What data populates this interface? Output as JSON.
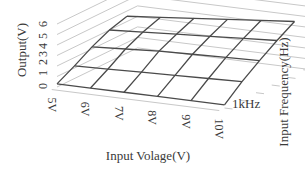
{
  "chart_data": {
    "type": "surface3d",
    "title": "",
    "xlabel": "Input Volage(V)",
    "ylabel": "Input Frequency(Hz)",
    "zlabel": "Output(V)",
    "x_ticks": [
      "5V",
      "6V",
      "7V",
      "8V",
      "9V",
      "10V"
    ],
    "y_ticks": [
      "1kHz"
    ],
    "z_ticks": [
      "0",
      "1",
      "2",
      "3",
      "4",
      "5",
      "6"
    ],
    "zlim": [
      0,
      6
    ],
    "grid": true,
    "legend": null,
    "x": [
      5,
      6,
      7,
      8,
      9,
      10
    ],
    "y_index": [
      0,
      1,
      2,
      3,
      4
    ],
    "z": [
      [
        0.3,
        0.3,
        0.3,
        0.3,
        0.3,
        0.3
      ],
      [
        1.2,
        1.3,
        1.4,
        1.5,
        1.6,
        1.7
      ],
      [
        2.2,
        2.4,
        2.6,
        2.7,
        2.8,
        2.9
      ],
      [
        3.0,
        3.2,
        3.4,
        3.6,
        3.8,
        4.0
      ],
      [
        3.5,
        3.8,
        4.1,
        4.4,
        4.7,
        5.0
      ]
    ],
    "colors": {
      "mesh": "#4a4a4a",
      "grid": "#c8c8c8",
      "text": "#3a3a3a"
    }
  }
}
